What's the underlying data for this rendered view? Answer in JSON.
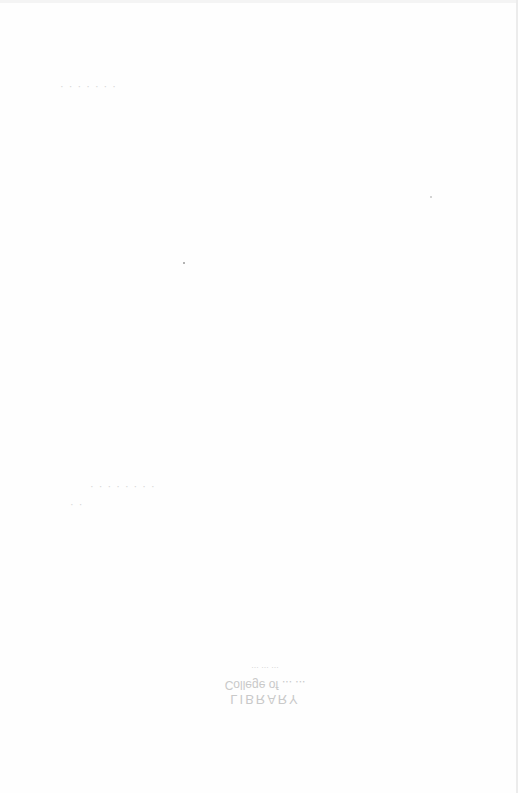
{
  "page": {
    "type": "blank scanned page with bleed-through",
    "background": "#fefefe"
  },
  "bleed_through": {
    "header_line": "· · · · · · ·",
    "mid_line": "· · · · · · · ·",
    "mid_line_2": "· ·"
  },
  "stamp": {
    "line1": "LIBRARY",
    "line2": "College of ... ...",
    "line3": "... ... ..."
  }
}
